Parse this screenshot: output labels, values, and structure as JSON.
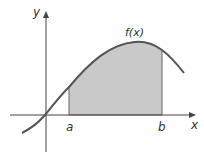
{
  "diagram": {
    "curve_label": "f(x)",
    "x_axis_label": "x",
    "y_axis_label": "y",
    "lower_bound_label": "a",
    "upper_bound_label": "b",
    "colors": {
      "shade": "#c8c8c8",
      "curve": "#555555",
      "axes": "#444444",
      "text": "#333333"
    }
  }
}
